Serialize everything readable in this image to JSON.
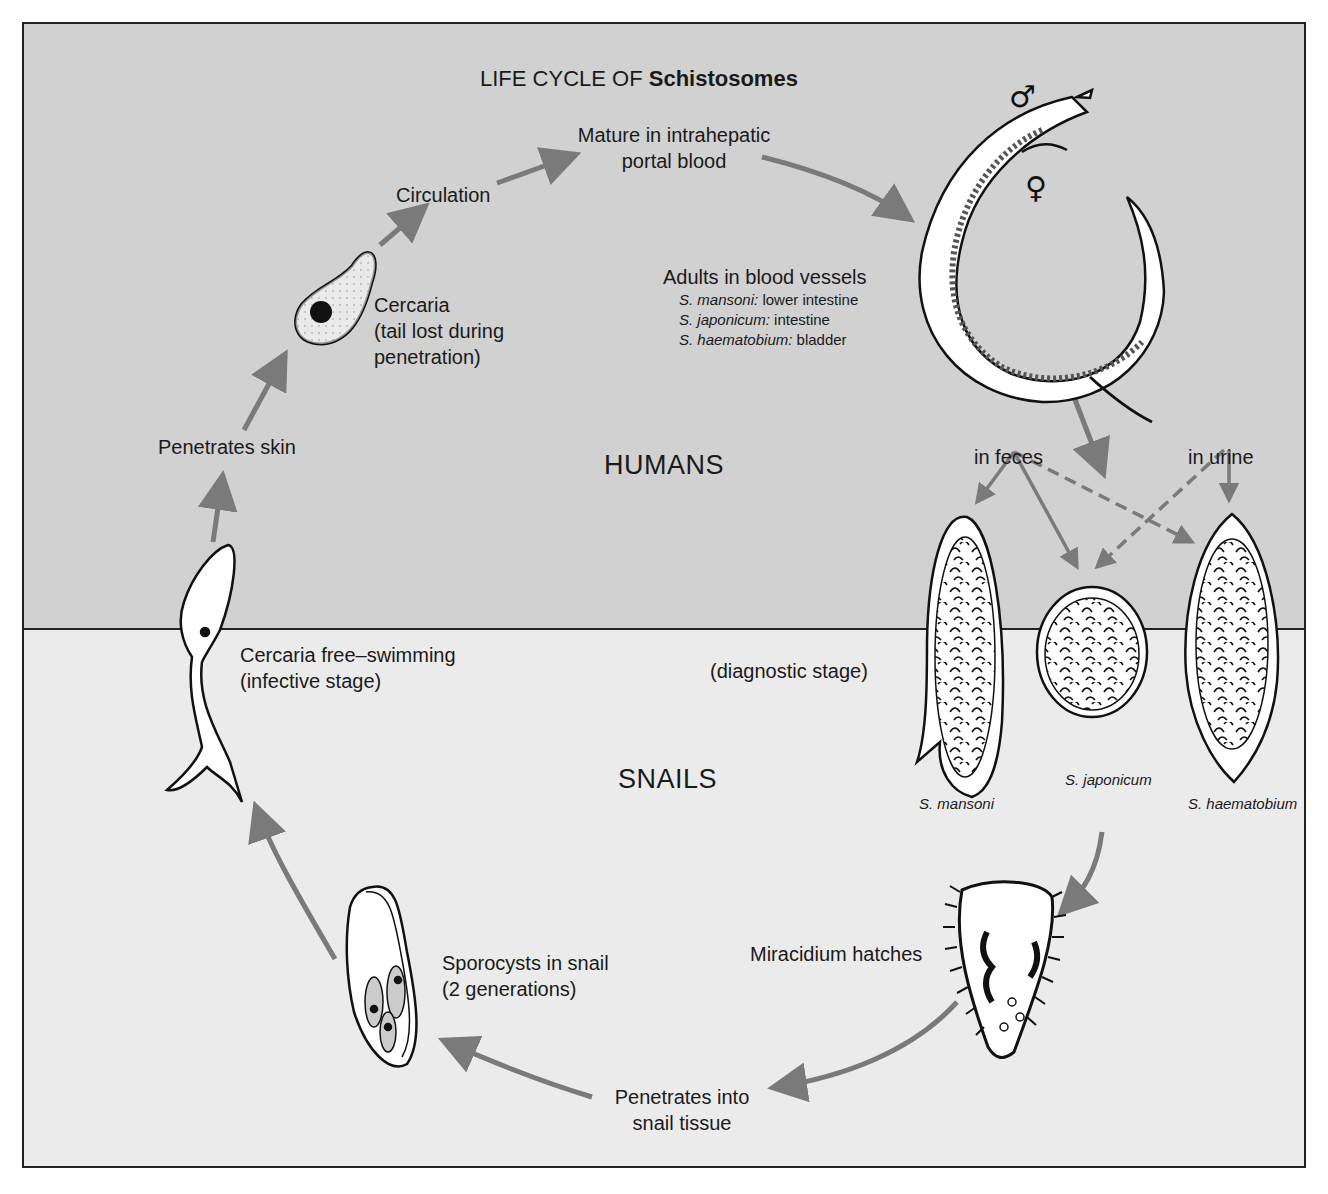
{
  "title": {
    "prefix": "LIFE CYCLE OF ",
    "organism": "Schistosomes"
  },
  "zones": {
    "humans": "HUMANS",
    "snails": "SNAILS"
  },
  "stages": {
    "mature": {
      "line1": "Mature in intrahepatic",
      "line2": "portal blood"
    },
    "circulation": "Circulation",
    "cercaria": {
      "line1": "Cercaria",
      "line2": "(tail lost during",
      "line3": "penetration)"
    },
    "penetrates_skin": "Penetrates skin",
    "adults": {
      "heading": "Adults in blood vessels",
      "sites": [
        {
          "species": "S. mansoni:",
          "site": " lower intestine"
        },
        {
          "species": "S. japonicum:",
          "site": " intestine"
        },
        {
          "species": "S. haematobium:",
          "site": " bladder"
        }
      ]
    },
    "in_feces": "in feces",
    "in_urine": "in urine",
    "diagnostic": "(diagnostic stage)",
    "cercaria_free": {
      "line1": "Cercaria free–swimming",
      "line2": "(infective stage)"
    },
    "eggs": [
      "S. mansoni",
      "S. japonicum",
      "S. haematobium"
    ],
    "miracidium": "Miracidium hatches",
    "sporocysts": {
      "line1": "Sporocysts in snail",
      "line2": "(2 generations)"
    },
    "penetrates_snail": {
      "line1": "Penetrates into",
      "line2": "snail tissue"
    }
  },
  "symbols": {
    "male": "♂",
    "female": "♀"
  },
  "colors": {
    "humans_bg": "#d1d1d1",
    "snails_bg": "#ebebeb",
    "arrow": "#7a7a7a",
    "ink": "#1a1a1a"
  }
}
